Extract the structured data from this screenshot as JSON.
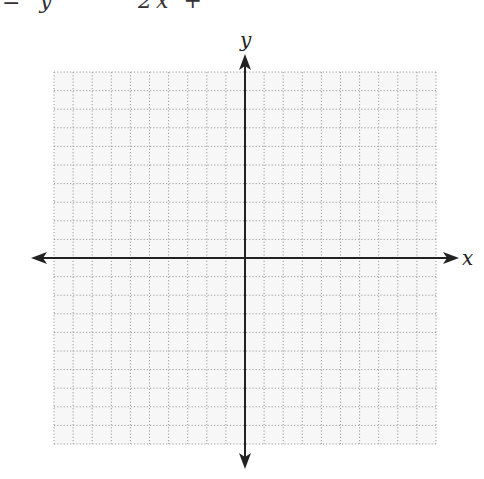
{
  "header": {
    "equation_left": "= y",
    "equation_right": "2x + ",
    "clipped": true
  },
  "graph": {
    "x_axis_label": "x",
    "y_axis_label": "y",
    "grid_cells_left": 10,
    "grid_cells_right": 10,
    "grid_cells_up": 10,
    "grid_cells_down": 10,
    "grid_style": "dotted",
    "axis_color": "#222222",
    "grid_color": "#9a9a9a",
    "grid_background": "#f7f7f7"
  }
}
